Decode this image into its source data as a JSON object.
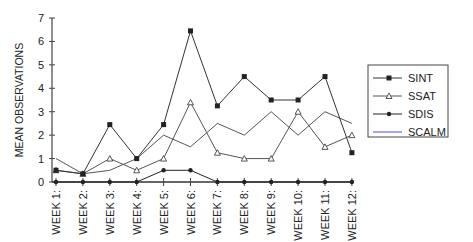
{
  "chart_data": {
    "type": "line",
    "title": "",
    "xlabel": "",
    "ylabel": "MEAN OBSERVATIONS",
    "ylim": [
      0,
      7
    ],
    "yticks": [
      0,
      1,
      2,
      3,
      4,
      5,
      6,
      7
    ],
    "grid": false,
    "legend_position": "right",
    "categories": [
      "WEEK 1:",
      "WEEK 2:",
      "WEEK 3:",
      "WEEK 4:",
      "WEEK 5:",
      "WEEK 6:",
      "WEEK 7:",
      "WEEK 8:",
      "WEEK 9:",
      "WEEK 10:",
      "WEEK 11:",
      "WEEK 12:"
    ],
    "series": [
      {
        "name": "SINT",
        "marker": "filled-square",
        "color": "#333333",
        "values": [
          0.5,
          0.35,
          2.45,
          1.0,
          2.45,
          6.45,
          3.25,
          4.5,
          3.5,
          3.5,
          4.5,
          1.25
        ]
      },
      {
        "name": "SSAT",
        "marker": "open-triangle",
        "color": "#555555",
        "values": [
          0.5,
          0.35,
          1.0,
          0.5,
          1.0,
          3.4,
          1.25,
          1.0,
          1.0,
          3.0,
          1.5,
          2.0
        ]
      },
      {
        "name": "SDIS",
        "marker": "filled-circle",
        "color": "#222222",
        "values": [
          0,
          0,
          0,
          0,
          0.5,
          0.5,
          0,
          0,
          0,
          0,
          0,
          0
        ]
      },
      {
        "name": "SCALM",
        "marker": "none",
        "color": "#555555",
        "legend_color": "#4a4adf",
        "values": [
          1.0,
          0.35,
          0.5,
          1.0,
          2.0,
          1.5,
          2.5,
          2.0,
          3.0,
          2.0,
          3.0,
          2.5
        ]
      }
    ]
  }
}
